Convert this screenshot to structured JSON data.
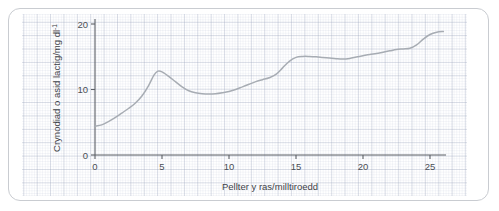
{
  "chart_data": {
    "type": "line",
    "title": "",
    "xlabel": "Pellter y ras/milltiroedd",
    "ylabel": "Crynodiad o asid lactig/mg dl",
    "ylabel_superscript": "-1",
    "xlim": [
      0,
      26.5
    ],
    "ylim": [
      0,
      21.5
    ],
    "xticks": [
      0,
      5,
      10,
      15,
      20,
      25
    ],
    "xticklabels": [
      "0",
      "5",
      "10",
      "15",
      "20",
      "25"
    ],
    "yticks": [
      0,
      10,
      20
    ],
    "yticklabels": [
      "0",
      "10",
      "20"
    ],
    "grid": true,
    "grid_style": "graph-paper minor and major squares",
    "legend": "none",
    "line_color": "#a7acb3",
    "axis_color": "#5c6066",
    "grid_color": "#96a0b9",
    "background_color": "#ffffff",
    "frame_color": "#c9ccd1",
    "series": [
      {
        "name": "Crynodiad o asid lactig",
        "x": [
          0.0,
          0.5,
          1.0,
          1.5,
          2.0,
          2.5,
          3.0,
          3.5,
          4.0,
          4.4,
          4.7,
          5.0,
          5.5,
          6.0,
          6.5,
          7.0,
          7.5,
          8.0,
          8.5,
          9.0,
          9.5,
          10.0,
          10.5,
          11.0,
          11.5,
          12.0,
          12.5,
          13.0,
          13.5,
          14.0,
          14.5,
          15.0,
          15.5,
          16.0,
          16.5,
          17.0,
          17.5,
          18.0,
          18.5,
          19.0,
          19.5,
          20.0,
          20.5,
          21.0,
          21.5,
          22.0,
          22.5,
          23.0,
          23.5,
          24.0,
          24.5,
          25.0,
          25.5,
          26.0
        ],
        "y": [
          4.4,
          4.6,
          5.1,
          5.7,
          6.4,
          7.1,
          7.9,
          9.0,
          10.6,
          12.2,
          12.8,
          12.7,
          12.0,
          11.2,
          10.4,
          9.8,
          9.5,
          9.35,
          9.3,
          9.35,
          9.5,
          9.7,
          10.0,
          10.4,
          10.8,
          11.2,
          11.5,
          11.8,
          12.3,
          13.3,
          14.3,
          14.9,
          15.05,
          15.05,
          15.0,
          14.9,
          14.8,
          14.7,
          14.65,
          14.75,
          14.95,
          15.15,
          15.35,
          15.5,
          15.7,
          15.9,
          16.1,
          16.2,
          16.3,
          16.8,
          17.7,
          18.4,
          18.75,
          18.85
        ]
      }
    ]
  }
}
